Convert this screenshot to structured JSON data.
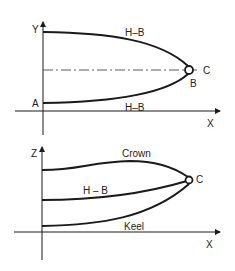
{
  "top_diagram": {
    "axis_y": "Y",
    "axis_x": "X",
    "upper_curve_label": "H–B",
    "lower_curve_label": "H–B",
    "point_a": "A",
    "point_b": "B",
    "point_c": "C"
  },
  "bottom_diagram": {
    "axis_z": "Z",
    "axis_x": "X",
    "crown_label": "Crown",
    "middle_curve_label": "H – B",
    "keel_label": "Keel",
    "point_c": "C"
  },
  "colors": {
    "ink": "#1a1a1a"
  }
}
